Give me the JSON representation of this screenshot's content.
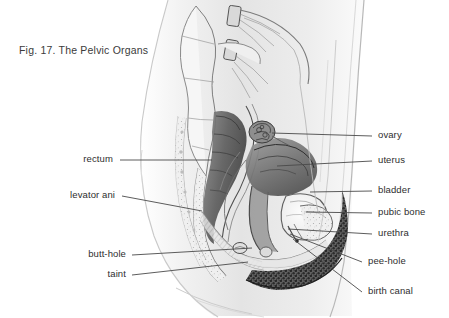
{
  "figure": {
    "title": "Fig. 17. The Pelvic Organs",
    "illustration_name": "sagittal-section-female-pelvis-pencil-drawing",
    "background_color": "#ffffff",
    "text_color": "#2e2e2e",
    "line_color": "#4a4a4a"
  },
  "labels": {
    "left": [
      {
        "name": "rectum",
        "text": "rectum",
        "text_x": 113,
        "text_y": 163,
        "line": {
          "x1": 120,
          "y1": 160,
          "x2": 212,
          "y2": 160
        }
      },
      {
        "name": "levator-ani",
        "text": "levator ani",
        "text_x": 115,
        "text_y": 199,
        "line": {
          "x1": 122,
          "y1": 196,
          "x2": 202,
          "y2": 211
        }
      },
      {
        "name": "butt-hole",
        "text": "butt-hole",
        "text_x": 126,
        "text_y": 258,
        "line": {
          "x1": 132,
          "y1": 255,
          "x2": 252,
          "y2": 248
        }
      },
      {
        "name": "taint",
        "text": "taint",
        "text_x": 126,
        "text_y": 278,
        "line": {
          "x1": 132,
          "y1": 275,
          "x2": 248,
          "y2": 262
        }
      }
    ],
    "right": [
      {
        "name": "ovary",
        "text": "ovary",
        "text_x": 378,
        "text_y": 139,
        "line": {
          "x1": 372,
          "y1": 136,
          "x2": 272,
          "y2": 133
        }
      },
      {
        "name": "uterus",
        "text": "uterus",
        "text_x": 378,
        "text_y": 164,
        "line": {
          "x1": 372,
          "y1": 161,
          "x2": 277,
          "y2": 166
        }
      },
      {
        "name": "bladder",
        "text": "bladder",
        "text_x": 378,
        "text_y": 194,
        "line": {
          "x1": 372,
          "y1": 191,
          "x2": 310,
          "y2": 192
        }
      },
      {
        "name": "pubic-bone",
        "text": "pubic bone",
        "text_x": 378,
        "text_y": 216,
        "line": {
          "x1": 372,
          "y1": 213,
          "x2": 306,
          "y2": 212
        }
      },
      {
        "name": "urethra",
        "text": "urethra",
        "text_x": 378,
        "text_y": 237,
        "line": {
          "x1": 372,
          "y1": 234,
          "x2": 288,
          "y2": 229
        }
      },
      {
        "name": "pee-hole",
        "text": "pee-hole",
        "text_x": 368,
        "text_y": 265,
        "line": {
          "x1": 362,
          "y1": 262,
          "x2": 290,
          "y2": 234
        }
      },
      {
        "name": "birth-canal",
        "text": "birth canal",
        "text_x": 368,
        "text_y": 295,
        "line": {
          "x1": 362,
          "y1": 292,
          "x2": 293,
          "y2": 239
        }
      }
    ]
  }
}
